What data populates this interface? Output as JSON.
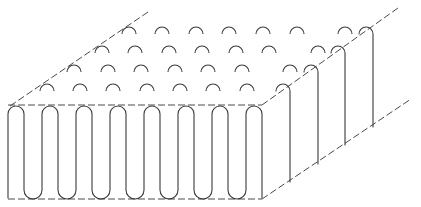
{
  "figure": {
    "type": "isometric line drawing",
    "colors": {
      "line": "#3a3a3a",
      "background": "#ffffff"
    },
    "front_face": {
      "left_x": 8,
      "right_x": 262,
      "top_y": 105,
      "bottom_y": 199,
      "top_arch_count": 8,
      "bottom_turn_count": 7,
      "loop_pitch": 34,
      "loop_width": 16
    },
    "top_face": {
      "arch_rows": 4,
      "arches_per_row": 7,
      "arch_radius": 7,
      "row_offset": {
        "dx": 17,
        "dy": -19
      }
    },
    "right_face": {
      "vertical_wires": 4
    }
  }
}
